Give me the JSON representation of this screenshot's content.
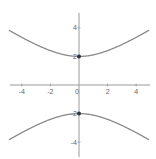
{
  "chart_data": {
    "type": "line",
    "title": "",
    "xlabel": "",
    "ylabel": "",
    "equation": "y^2/4 - x^2/9 = 1",
    "xlim": [
      -4.9,
      4.9
    ],
    "ylim": [
      -5,
      5
    ],
    "grid": false,
    "legend": null,
    "x_ticks": [
      -4,
      -2,
      0,
      2,
      4
    ],
    "x_tick_labels": [
      "-4",
      "-2",
      "0",
      "2",
      "4"
    ],
    "y_ticks": [
      4,
      2,
      -2,
      -4
    ],
    "y_tick_labels": [
      "4",
      "2",
      "-2",
      "-4"
    ],
    "series": [
      {
        "name": "upper branch",
        "x": [
          -4.9,
          -4,
          -3,
          -2,
          -1,
          0,
          1,
          2,
          3,
          4,
          4.9
        ],
        "y": [
          3.83,
          3.33,
          2.83,
          2.4,
          2.11,
          2.0,
          2.11,
          2.4,
          2.83,
          3.33,
          3.83
        ]
      },
      {
        "name": "lower branch",
        "x": [
          -4.9,
          -4,
          -3,
          -2,
          -1,
          0,
          1,
          2,
          3,
          4,
          4.9
        ],
        "y": [
          -3.83,
          -3.33,
          -2.83,
          -2.4,
          -2.11,
          -2.0,
          -2.11,
          -2.4,
          -2.83,
          -3.33,
          -3.83
        ]
      }
    ],
    "points": [
      {
        "label": "vertex-top",
        "x": 0,
        "y": 2
      },
      {
        "label": "vertex-bottom",
        "x": 0,
        "y": -2
      }
    ]
  },
  "colors": {
    "curve": "#8a8a8a",
    "axis": "#9a9a9a",
    "point": "#333333",
    "label": "#666666"
  },
  "layout": {
    "origin_px": [
      79,
      85
    ],
    "px_per_unit": 14.3,
    "x_axis_px": [
      10,
      150
    ],
    "y_axis_px": [
      13,
      157
    ]
  }
}
